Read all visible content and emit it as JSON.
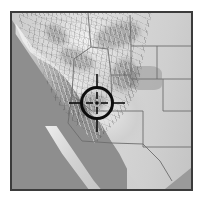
{
  "figure": {
    "kind": "locator-map",
    "title": "",
    "caption": "",
    "width_px": 204,
    "height_px": 201
  },
  "map": {
    "region_depicted": "Western United States",
    "render_style": "grayscale shaded relief",
    "projection_note": "",
    "frame": {
      "border_color": "#3b3b3b",
      "border_width_px": 2,
      "left_px": 10,
      "top_px": 11,
      "width_px": 183,
      "height_px": 180
    },
    "colors": {
      "ocean": "#8e8e8e",
      "gulf": "#9a9a9a",
      "land_low": "#c4c4c4",
      "land_mid": "#d6d6d6",
      "land_high": "#f2f2f2",
      "plains": "#d8d8d8",
      "state_boundary": "#6d6d6d",
      "page_background": "#ffffff"
    },
    "features": [
      {
        "name": "pacific-ocean",
        "type": "water",
        "position": "west"
      },
      {
        "name": "coast-ranges",
        "type": "relief",
        "position": "west-coast"
      },
      {
        "name": "sierra-nevada",
        "type": "relief",
        "position": "west-central"
      },
      {
        "name": "cascade-range",
        "type": "relief",
        "position": "northwest"
      },
      {
        "name": "great-basin",
        "type": "relief",
        "position": "center"
      },
      {
        "name": "rocky-mountains",
        "type": "relief",
        "position": "north-center"
      },
      {
        "name": "colorado-plateau",
        "type": "relief",
        "position": "south-center"
      },
      {
        "name": "great-plains",
        "type": "plain",
        "position": "east"
      },
      {
        "name": "baja-california",
        "type": "peninsula",
        "position": "southwest"
      },
      {
        "name": "gulf-of-california",
        "type": "water",
        "position": "southwest"
      }
    ],
    "state_boundaries_visible": true
  },
  "marker": {
    "type": "crosshair-target",
    "label": "",
    "color": "#0d0d0d",
    "center_x_px": 97,
    "center_y_px": 102,
    "circle_radius_px": 16,
    "circle_stroke_px": 3,
    "tick_length_px": 22,
    "tick_stroke_px": 1.6,
    "dot_radius_px": 1.8
  }
}
